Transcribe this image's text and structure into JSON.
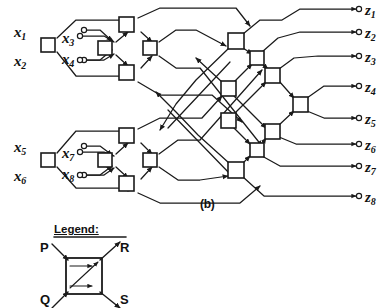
{
  "figure": {
    "caption": "(b)",
    "title_text": "8-input 8-output multistage interconnection / sorting switch network"
  },
  "inputs": [
    {
      "name": "x1",
      "base": "x",
      "sub": "1",
      "x": 18,
      "y": 32,
      "port_x": 86,
      "port_y": 30
    },
    {
      "name": "x2",
      "base": "x",
      "sub": "2",
      "x": 18,
      "y": 62,
      "port_x": 86,
      "port_y": 60
    },
    {
      "name": "x3",
      "base": "x",
      "sub": "3",
      "x": 68,
      "y": 42,
      "port_x": 78,
      "port_y": 36
    },
    {
      "name": "x4",
      "base": "x",
      "sub": "4",
      "x": 68,
      "y": 60,
      "port_x": 78,
      "port_y": 60
    },
    {
      "name": "x5",
      "base": "x",
      "sub": "5",
      "x": 18,
      "y": 148,
      "port_x": 86,
      "port_y": 146
    },
    {
      "name": "x6",
      "base": "x",
      "sub": "6",
      "x": 18,
      "y": 177,
      "port_x": 86,
      "port_y": 175
    },
    {
      "name": "x7",
      "base": "x",
      "sub": "7",
      "x": 68,
      "y": 157,
      "port_x": 78,
      "port_y": 152
    },
    {
      "name": "x8",
      "base": "x",
      "sub": "8",
      "x": 68,
      "y": 174,
      "port_x": 78,
      "port_y": 175
    }
  ],
  "outputs": [
    {
      "name": "z1",
      "base": "z",
      "sub": "1",
      "x": 368,
      "y": 12,
      "port_x": 362,
      "port_y": 13
    },
    {
      "name": "z2",
      "base": "z",
      "sub": "2",
      "x": 368,
      "y": 38,
      "port_x": 362,
      "port_y": 36
    },
    {
      "name": "z3",
      "base": "z",
      "sub": "3",
      "x": 368,
      "y": 62,
      "port_x": 362,
      "port_y": 60
    },
    {
      "name": "z4",
      "base": "z",
      "sub": "4",
      "x": 368,
      "y": 91,
      "port_x": 362,
      "port_y": 89
    },
    {
      "name": "z5",
      "base": "z",
      "sub": "5",
      "x": 368,
      "y": 120,
      "port_x": 362,
      "port_y": 118
    },
    {
      "name": "z6",
      "base": "z",
      "sub": "6",
      "x": 368,
      "y": 146,
      "port_x": 362,
      "port_y": 144
    },
    {
      "name": "z7",
      "base": "z",
      "sub": "7",
      "x": 368,
      "y": 168,
      "port_x": 362,
      "port_y": 166
    },
    {
      "name": "z8",
      "base": "z",
      "sub": "8",
      "x": 368,
      "y": 196,
      "port_x": 362,
      "port_y": 194
    }
  ],
  "legend": {
    "title": "Legend:",
    "terminals": [
      {
        "label": "P",
        "role": "input-top-left",
        "x": 44,
        "y": 250
      },
      {
        "label": "R",
        "role": "output-top-right",
        "x": 124,
        "y": 250
      },
      {
        "label": "Q",
        "role": "input-bottom-left",
        "x": 44,
        "y": 292
      },
      {
        "label": "S",
        "role": "output-bottom-right",
        "x": 124,
        "y": 292
      }
    ],
    "box": {
      "x": 66,
      "y": 258,
      "size": 36
    },
    "internal_paths": [
      "P-to-R",
      "Q-to-R",
      "Q-to-S"
    ]
  },
  "colors": {
    "line": "#1a1a1a",
    "background": "#ffffff",
    "node_fill": "#ffffff"
  },
  "nodes": [
    {
      "id": "A1",
      "cx": 48,
      "cy": 45,
      "stage": 0,
      "group": "top"
    },
    {
      "id": "B1",
      "cx": 105,
      "cy": 48,
      "stage": 1,
      "group": "top"
    },
    {
      "id": "B2",
      "cx": 126,
      "cy": 24,
      "stage": 1,
      "group": "top"
    },
    {
      "id": "B3",
      "cx": 126,
      "cy": 72,
      "stage": 1,
      "group": "top"
    },
    {
      "id": "B4",
      "cx": 150,
      "cy": 48,
      "stage": 1,
      "group": "top"
    },
    {
      "id": "A2",
      "cx": 48,
      "cy": 160,
      "stage": 0,
      "group": "bot"
    },
    {
      "id": "C1",
      "cx": 105,
      "cy": 160,
      "stage": 1,
      "group": "bot"
    },
    {
      "id": "C2",
      "cx": 126,
      "cy": 135,
      "stage": 1,
      "group": "bot"
    },
    {
      "id": "C3",
      "cx": 126,
      "cy": 183,
      "stage": 1,
      "group": "bot"
    },
    {
      "id": "C4",
      "cx": 150,
      "cy": 160,
      "stage": 1,
      "group": "bot"
    },
    {
      "id": "D1",
      "cx": 236,
      "cy": 41,
      "stage": 2,
      "group": "mid"
    },
    {
      "id": "D2",
      "cx": 228,
      "cy": 89,
      "stage": 2,
      "group": "mid"
    },
    {
      "id": "D3",
      "cx": 228,
      "cy": 121,
      "stage": 2,
      "group": "mid"
    },
    {
      "id": "D4",
      "cx": 236,
      "cy": 170,
      "stage": 2,
      "group": "mid"
    },
    {
      "id": "E1",
      "cx": 256,
      "cy": 58,
      "stage": 3,
      "group": "out"
    },
    {
      "id": "E2",
      "cx": 272,
      "cy": 75,
      "stage": 3,
      "group": "out"
    },
    {
      "id": "E3",
      "cx": 300,
      "cy": 104,
      "stage": 3,
      "group": "out"
    },
    {
      "id": "E4",
      "cx": 272,
      "cy": 131,
      "stage": 3,
      "group": "out"
    },
    {
      "id": "E5",
      "cx": 256,
      "cy": 150,
      "stage": 3,
      "group": "out"
    }
  ]
}
